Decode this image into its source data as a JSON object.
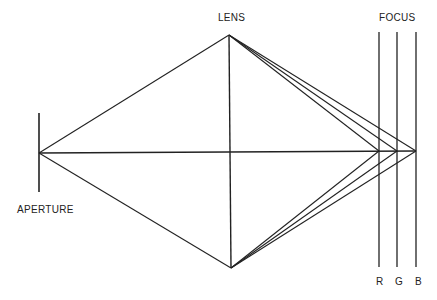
{
  "diagram": {
    "labels": {
      "lens": "LENS",
      "focus": "FOCUS",
      "aperture": "APERTURE",
      "r": "R",
      "g": "G",
      "b": "B"
    },
    "colors": {
      "line": "#222222",
      "background": "#ffffff"
    },
    "geometry": {
      "aperture_x": 39,
      "aperture_y_top": 113,
      "aperture_y_bottom": 192,
      "source_point": [
        39,
        153
      ],
      "lens_top": [
        229,
        35
      ],
      "lens_bottom": [
        231,
        268
      ],
      "focus_points": {
        "R": [
          379,
          151
        ],
        "G": [
          397,
          151
        ],
        "B": [
          416,
          151
        ]
      },
      "focus_lines_x": [
        379,
        397,
        416
      ],
      "focus_lines_y": [
        32,
        267
      ]
    }
  }
}
